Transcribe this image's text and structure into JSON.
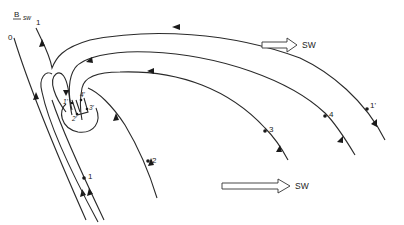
{
  "diagram": {
    "field_label": "B",
    "field_subscript": "sw",
    "line_labels": {
      "line0": "0",
      "line1_top": "1"
    },
    "points": [
      {
        "id": "p1",
        "label": "1"
      },
      {
        "id": "p2",
        "label": "2"
      },
      {
        "id": "p3",
        "label": "3"
      },
      {
        "id": "p4",
        "label": "4"
      },
      {
        "id": "p1prime",
        "label": "1'"
      }
    ],
    "inner_points": [
      {
        "id": "q1prime",
        "label": "1'"
      },
      {
        "id": "q2prime",
        "label": "2'"
      },
      {
        "id": "q3prime",
        "label": "3'"
      },
      {
        "id": "q4prime",
        "label": "4'"
      }
    ],
    "flow_arrows": [
      {
        "id": "sw-top",
        "label": "SW"
      },
      {
        "id": "sw-bottom",
        "label": "SW"
      }
    ],
    "colors": {
      "stroke": "#2a2a2a",
      "background": "#ffffff"
    }
  }
}
